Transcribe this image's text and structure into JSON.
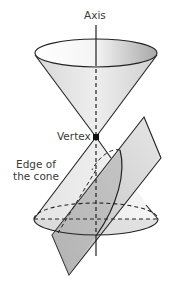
{
  "diagram": {
    "type": "double-napped cone intersected by a plane",
    "labels": {
      "axis": "Axis",
      "vertex": "Vertex",
      "edge": "Edge of the cone"
    },
    "colors": {
      "stroke": "#222222",
      "cone_fill_light": "#ededed",
      "cone_fill_dark": "#b8b8b8",
      "plane_fill": "#c9c9c9",
      "plane_overlap_fill": "#a9a9a9",
      "label_text": "#3a3a3a"
    },
    "geometry": {
      "vertex": [
        96,
        137
      ],
      "top_ellipse": {
        "cx": 96,
        "cy": 53,
        "rx": 61,
        "ry": 14
      },
      "bottom_ellipse": {
        "cx": 96,
        "cy": 220,
        "rx": 62,
        "ry": 16
      },
      "plane_corners": [
        [
          144,
          117
        ],
        [
          161,
          158
        ],
        [
          69,
          275
        ],
        [
          52,
          235
        ]
      ]
    }
  }
}
